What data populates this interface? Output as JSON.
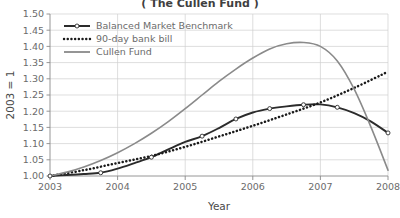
{
  "chart_data": {
    "type": "line",
    "title": "( The Cullen Fund )",
    "xlabel": "Year",
    "ylabel": "2003 = 1",
    "xlim": [
      2003,
      2008
    ],
    "ylim": [
      1.0,
      1.5
    ],
    "ytick_step": 0.05,
    "grid": true,
    "legend_position": "top-left",
    "xticks": [
      "2003",
      "2004",
      "2005",
      "2006",
      "2007",
      "2008"
    ],
    "yticks": [
      "1.00",
      "1.05",
      "1.10",
      "1.15",
      "1.20",
      "1.25",
      "1.30",
      "1.35",
      "1.40",
      "1.45",
      "1.50"
    ],
    "series": [
      {
        "name": "Balanced Market Benchmark",
        "color": "#2b2b2b",
        "style": "solid-markers",
        "width": 1.9,
        "x": [
          2003.0,
          2003.25,
          2003.5,
          2003.75,
          2004.0,
          2004.25,
          2004.5,
          2004.75,
          2005.0,
          2005.25,
          2005.5,
          2005.75,
          2006.0,
          2006.25,
          2006.5,
          2006.75,
          2007.0,
          2007.25,
          2007.5,
          2007.75,
          2008.0
        ],
        "values": [
          1.0,
          1.003,
          1.006,
          1.01,
          1.023,
          1.04,
          1.058,
          1.082,
          1.105,
          1.123,
          1.148,
          1.176,
          1.196,
          1.208,
          1.215,
          1.22,
          1.221,
          1.212,
          1.194,
          1.168,
          1.133
        ],
        "marker_x": [
          2003.0,
          2003.75,
          2004.5,
          2005.25,
          2005.75,
          2006.25,
          2006.75,
          2007.25,
          2008.0
        ],
        "marker_values": [
          1.0,
          1.01,
          1.058,
          1.123,
          1.176,
          1.208,
          1.22,
          1.212,
          1.133
        ]
      },
      {
        "name": "90-day bank bill",
        "color": "#1a1a1a",
        "style": "dotted",
        "width": 2.5,
        "x": [
          2003.0,
          2003.5,
          2004.0,
          2004.5,
          2005.0,
          2005.5,
          2006.0,
          2006.5,
          2007.0,
          2007.5,
          2008.0
        ],
        "values": [
          1.0,
          1.018,
          1.04,
          1.062,
          1.09,
          1.122,
          1.155,
          1.19,
          1.227,
          1.272,
          1.322
        ]
      },
      {
        "name": "Cullen Fund",
        "color": "#8a8a8a",
        "style": "solid",
        "width": 1.6,
        "x": [
          2003.0,
          2003.25,
          2003.5,
          2003.75,
          2004.0,
          2004.25,
          2004.5,
          2004.75,
          2005.0,
          2005.25,
          2005.5,
          2005.75,
          2006.0,
          2006.25,
          2006.5,
          2006.75,
          2007.0,
          2007.25,
          2007.5,
          2007.75,
          2008.0
        ],
        "values": [
          1.0,
          1.012,
          1.028,
          1.048,
          1.072,
          1.1,
          1.132,
          1.168,
          1.208,
          1.25,
          1.292,
          1.33,
          1.364,
          1.392,
          1.408,
          1.412,
          1.4,
          1.355,
          1.268,
          1.15,
          1.018
        ]
      }
    ]
  },
  "legend": {
    "items": [
      {
        "label": "Balanced Market Benchmark"
      },
      {
        "label": "90-day bank bill"
      },
      {
        "label": "Cullen Fund"
      }
    ]
  }
}
